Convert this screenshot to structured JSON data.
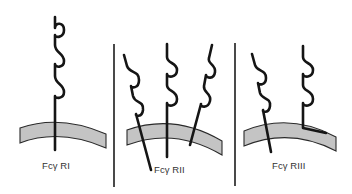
{
  "figure": {
    "colors": {
      "background": "#ffffff",
      "membrane_fill": "#c4c4c4",
      "membrane_edge": "#2a2a2a",
      "receptor_stroke": "#151515",
      "divider": "#1c1c1c",
      "label_text": "#333333"
    },
    "panels": [
      {
        "id": "fcgr1",
        "label": "Fcγ RI",
        "receptor_count": 1,
        "ig_domains_per_receptor": 3,
        "anchor_type": "transmembrane"
      },
      {
        "id": "fcgr2",
        "label": "Fcγ RII",
        "receptor_count": 3,
        "ig_domains_per_receptor": 2,
        "anchor_type": "transmembrane"
      },
      {
        "id": "fcgr3",
        "label": "Fcγ RIII",
        "receptor_count": 2,
        "ig_domains_per_receptor": 2,
        "anchor_type": "transmembrane + GPI-linked"
      }
    ]
  }
}
